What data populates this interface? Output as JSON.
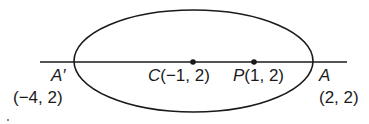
{
  "diagram": {
    "type": "ellipse-with-major-axis",
    "colors": {
      "stroke": "#1a1a1a",
      "background": "#ffffff"
    },
    "ellipse": {
      "cx": 193.5,
      "cy": 61,
      "rx": 119.5,
      "ry": 51
    },
    "axis_line": {
      "x1": 40,
      "y1": 62,
      "x2": 347,
      "y2": 62
    },
    "points": [
      {
        "id": "A_prime",
        "name": "A′",
        "coords": "(−4, 2)",
        "x": 74,
        "y": 62,
        "dot": false
      },
      {
        "id": "C",
        "name": "C",
        "coords": "(−1, 2)",
        "x": 193,
        "y": 62,
        "dot": true
      },
      {
        "id": "P",
        "name": "P",
        "coords": "(1, 2)",
        "x": 254,
        "y": 62,
        "dot": true
      },
      {
        "id": "A",
        "name": "A",
        "coords": "(2, 2)",
        "x": 313,
        "y": 62,
        "dot": false
      }
    ],
    "labels": {
      "a_prime_name": "A′",
      "a_prime_coords": "(−4, 2)",
      "c_name": "C",
      "c_coords": "(−1, 2)",
      "p_name": "P",
      "p_coords": "(1, 2)",
      "a_name": "A",
      "a_coords": "(2, 2)"
    }
  }
}
